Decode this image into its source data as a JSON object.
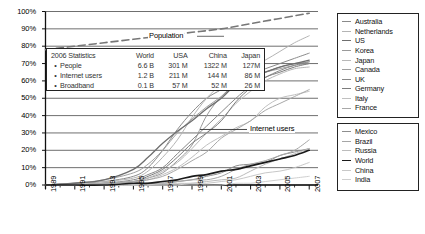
{
  "chart_data": {
    "type": "line",
    "title": "",
    "xlabel": "",
    "ylabel": "",
    "xlim": [
      1989,
      2007.6
    ],
    "ylim": [
      0,
      1.04
    ],
    "grid": true,
    "y_ticks": [
      "0%",
      "10%",
      "20%",
      "30%",
      "40%",
      "50%",
      "60%",
      "70%",
      "80%",
      "90%",
      "100%"
    ],
    "y_tick_values": [
      0,
      10,
      20,
      30,
      40,
      50,
      60,
      70,
      80,
      90,
      100
    ],
    "x_ticks": [
      "1989",
      "1991",
      "1993",
      "1995",
      "1997",
      "1999",
      "2001",
      "2003",
      "2005",
      "2007"
    ],
    "x_tick_values": [
      1989,
      1991,
      1993,
      1995,
      1997,
      1999,
      2001,
      2003,
      2005,
      2007
    ],
    "x_minor_step": 1,
    "annotations": [
      {
        "text": "Population",
        "x": 1999,
        "y": 86
      },
      {
        "text": "Internet users",
        "x": 2003.4,
        "y": 32
      }
    ],
    "legend_position": "right-outside",
    "series": [
      {
        "name": "Population",
        "style": "dashed",
        "color": "#777777",
        "width": 1.6,
        "x": [
          1989,
          1991,
          1993,
          1995,
          1997,
          1999,
          2001,
          2003,
          2005,
          2007
        ],
        "values": [
          78,
          80,
          82,
          84,
          86,
          88,
          90,
          93,
          96,
          99
        ]
      },
      {
        "name": "Australia",
        "color": "#8a8a8a",
        "width": 1.0,
        "x": [
          1989,
          1991,
          1993,
          1995,
          1996,
          1997,
          1998,
          1999,
          2000,
          2001,
          2002,
          2003,
          2004,
          2005,
          2006,
          2007
        ],
        "values": [
          0,
          1,
          2,
          5,
          10,
          20,
          32,
          42,
          50,
          55,
          60,
          64,
          67,
          70,
          73,
          76
        ]
      },
      {
        "name": "Netherlands",
        "color": "#b4b4b4",
        "width": 1.0,
        "x": [
          1989,
          1991,
          1993,
          1995,
          1996,
          1997,
          1998,
          1999,
          2000,
          2001,
          2002,
          2003,
          2004,
          2005,
          2006,
          2007
        ],
        "values": [
          0,
          1,
          2,
          4,
          8,
          16,
          26,
          39,
          50,
          58,
          64,
          68,
          72,
          77,
          82,
          86
        ]
      },
      {
        "name": "US",
        "color": "#6e6e6e",
        "width": 1.3,
        "x": [
          1989,
          1991,
          1993,
          1995,
          1996,
          1997,
          1998,
          1999,
          2000,
          2001,
          2002,
          2003,
          2004,
          2005,
          2006,
          2007
        ],
        "values": [
          0,
          1,
          3,
          9,
          16,
          24,
          31,
          37,
          44,
          50,
          58,
          62,
          65,
          68,
          70,
          72
        ]
      },
      {
        "name": "Korea",
        "color": "#9a9a9a",
        "width": 1.0,
        "x": [
          1989,
          1991,
          1993,
          1995,
          1996,
          1997,
          1998,
          1999,
          2000,
          2001,
          2002,
          2003,
          2004,
          2005,
          2006,
          2007
        ],
        "values": [
          0,
          0,
          1,
          2,
          4,
          7,
          14,
          23,
          40,
          51,
          58,
          62,
          65,
          68,
          70,
          71
        ]
      },
      {
        "name": "Japan",
        "color": "#b8b8b8",
        "width": 1.0,
        "x": [
          1989,
          1991,
          1993,
          1995,
          1996,
          1997,
          1998,
          1999,
          2000,
          2001,
          2002,
          2003,
          2004,
          2005,
          2006,
          2007
        ],
        "values": [
          0,
          0,
          1,
          2,
          4,
          8,
          13,
          21,
          30,
          38,
          47,
          54,
          60,
          64,
          67,
          68
        ]
      },
      {
        "name": "Canada",
        "color": "#a0a0a0",
        "width": 1.0,
        "x": [
          1989,
          1991,
          1993,
          1995,
          1996,
          1997,
          1998,
          1999,
          2000,
          2001,
          2002,
          2003,
          2004,
          2005,
          2006,
          2007
        ],
        "values": [
          0,
          1,
          3,
          7,
          12,
          20,
          30,
          38,
          45,
          51,
          58,
          62,
          65,
          67,
          69,
          70
        ]
      },
      {
        "name": "UK",
        "color": "#888888",
        "width": 1.0,
        "x": [
          1989,
          1991,
          1993,
          1995,
          1996,
          1997,
          1998,
          1999,
          2000,
          2001,
          2002,
          2003,
          2004,
          2005,
          2006,
          2007
        ],
        "values": [
          0,
          0,
          1,
          3,
          6,
          10,
          18,
          26,
          34,
          42,
          50,
          57,
          62,
          66,
          69,
          71
        ]
      },
      {
        "name": "Germany",
        "color": "#7c7c7c",
        "width": 1.0,
        "x": [
          1989,
          1991,
          1993,
          1995,
          1996,
          1997,
          1998,
          1999,
          2000,
          2001,
          2002,
          2003,
          2004,
          2005,
          2006,
          2007
        ],
        "values": [
          0,
          0,
          1,
          2,
          5,
          9,
          16,
          24,
          30,
          37,
          48,
          56,
          62,
          65,
          68,
          70
        ]
      },
      {
        "name": "Italy",
        "color": "#c0c0c0",
        "width": 1.0,
        "x": [
          1989,
          1991,
          1993,
          1995,
          1996,
          1997,
          1998,
          1999,
          2000,
          2001,
          2002,
          2003,
          2004,
          2005,
          2006,
          2007
        ],
        "values": [
          0,
          0,
          1,
          2,
          3,
          6,
          10,
          16,
          23,
          28,
          33,
          37,
          45,
          50,
          52,
          54
        ]
      },
      {
        "name": "France",
        "color": "#a8a8a8",
        "width": 1.0,
        "x": [
          1989,
          1991,
          1993,
          1995,
          1996,
          1997,
          1998,
          1999,
          2000,
          2001,
          2002,
          2003,
          2004,
          2005,
          2006,
          2007
        ],
        "values": [
          0,
          0,
          1,
          2,
          3,
          5,
          9,
          14,
          19,
          27,
          32,
          37,
          43,
          47,
          51,
          55
        ]
      },
      {
        "name": "Mexico",
        "color": "#8e8e8e",
        "width": 1.0,
        "x": [
          1989,
          1991,
          1993,
          1995,
          1996,
          1997,
          1998,
          1999,
          2000,
          2001,
          2002,
          2003,
          2004,
          2005,
          2006,
          2007
        ],
        "values": [
          0,
          0,
          0,
          0,
          1,
          1,
          2,
          3,
          5,
          7,
          11,
          12,
          13,
          17,
          19,
          21
        ]
      },
      {
        "name": "Brazil",
        "color": "#a6a6a6",
        "width": 1.0,
        "x": [
          1989,
          1991,
          1993,
          1995,
          1996,
          1997,
          1998,
          1999,
          2000,
          2001,
          2002,
          2003,
          2004,
          2005,
          2006,
          2007
        ],
        "values": [
          0,
          0,
          0,
          0,
          1,
          1,
          2,
          3,
          3,
          5,
          9,
          12,
          14,
          17,
          20,
          26
        ]
      },
      {
        "name": "Russia",
        "color": "#bcbcbc",
        "width": 1.0,
        "x": [
          1989,
          1991,
          1993,
          1995,
          1996,
          1997,
          1998,
          1999,
          2000,
          2001,
          2002,
          2003,
          2004,
          2005,
          2006,
          2007
        ],
        "values": [
          0,
          0,
          0,
          0,
          0,
          1,
          1,
          1,
          2,
          3,
          4,
          8,
          12,
          15,
          18,
          21
        ]
      },
      {
        "name": "World",
        "color": "#1a1a1a",
        "width": 1.7,
        "x": [
          1989,
          1991,
          1993,
          1995,
          1996,
          1997,
          1998,
          1999,
          2000,
          2001,
          2002,
          2003,
          2004,
          2005,
          2006,
          2007
        ],
        "values": [
          0,
          0,
          0,
          1,
          1,
          2,
          3,
          5,
          6,
          8,
          9,
          11,
          13,
          15,
          17,
          20
        ]
      },
      {
        "name": "China",
        "color": "#c8c8c8",
        "width": 1.0,
        "x": [
          1989,
          1991,
          1993,
          1995,
          1996,
          1997,
          1998,
          1999,
          2000,
          2001,
          2002,
          2003,
          2004,
          2005,
          2006,
          2007
        ],
        "values": [
          0,
          0,
          0,
          0,
          0,
          0,
          0,
          1,
          1,
          2,
          3,
          5,
          7,
          8,
          10,
          13
        ]
      },
      {
        "name": "India",
        "color": "#cfcfcf",
        "width": 1.0,
        "x": [
          1989,
          1991,
          1993,
          1995,
          1996,
          1997,
          1998,
          1999,
          2000,
          2001,
          2002,
          2003,
          2004,
          2005,
          2006,
          2007
        ],
        "values": [
          0,
          0,
          0,
          0,
          0,
          0,
          0,
          0,
          0,
          0,
          1,
          1,
          2,
          3,
          4,
          5
        ]
      }
    ]
  },
  "stats_table": {
    "title": "2006 Statistics",
    "columns": [
      "World",
      "USA",
      "China",
      "Japan"
    ],
    "rows": [
      {
        "label": "People",
        "values": [
          "6.6 B",
          "301 M",
          "1322 M",
          "127M"
        ]
      },
      {
        "label": "Internet users",
        "values": [
          "1.2 B",
          "211 M",
          "144 M",
          "86 M"
        ]
      },
      {
        "label": "Broadband",
        "values": [
          "0.1 B",
          "57 M",
          "52 M",
          "26 M"
        ]
      }
    ]
  },
  "legend_top": {
    "items": [
      {
        "label": "Australia",
        "color": "#8a8a8a",
        "width": 1.0
      },
      {
        "label": "Netherlands",
        "color": "#b4b4b4",
        "width": 1.0
      },
      {
        "label": "US",
        "color": "#6e6e6e",
        "width": 1.3
      },
      {
        "label": "Korea",
        "color": "#9a9a9a",
        "width": 1.0
      },
      {
        "label": "Japan",
        "color": "#b8b8b8",
        "width": 1.0
      },
      {
        "label": "Canada",
        "color": "#a0a0a0",
        "width": 1.0
      },
      {
        "label": "UK",
        "color": "#888888",
        "width": 1.0
      },
      {
        "label": "Germany",
        "color": "#7c7c7c",
        "width": 1.0
      },
      {
        "label": "Italy",
        "color": "#c0c0c0",
        "width": 1.0
      },
      {
        "label": "France",
        "color": "#a8a8a8",
        "width": 1.0
      }
    ]
  },
  "legend_bottom": {
    "items": [
      {
        "label": "Mexico",
        "color": "#8e8e8e",
        "width": 1.0
      },
      {
        "label": "Brazil",
        "color": "#a6a6a6",
        "width": 1.0
      },
      {
        "label": "Russia",
        "color": "#bcbcbc",
        "width": 1.0
      },
      {
        "label": "World",
        "color": "#1a1a1a",
        "width": 1.8
      },
      {
        "label": "China",
        "color": "#c8c8c8",
        "width": 1.0
      },
      {
        "label": "India",
        "color": "#cfcfcf",
        "width": 1.0
      }
    ]
  }
}
